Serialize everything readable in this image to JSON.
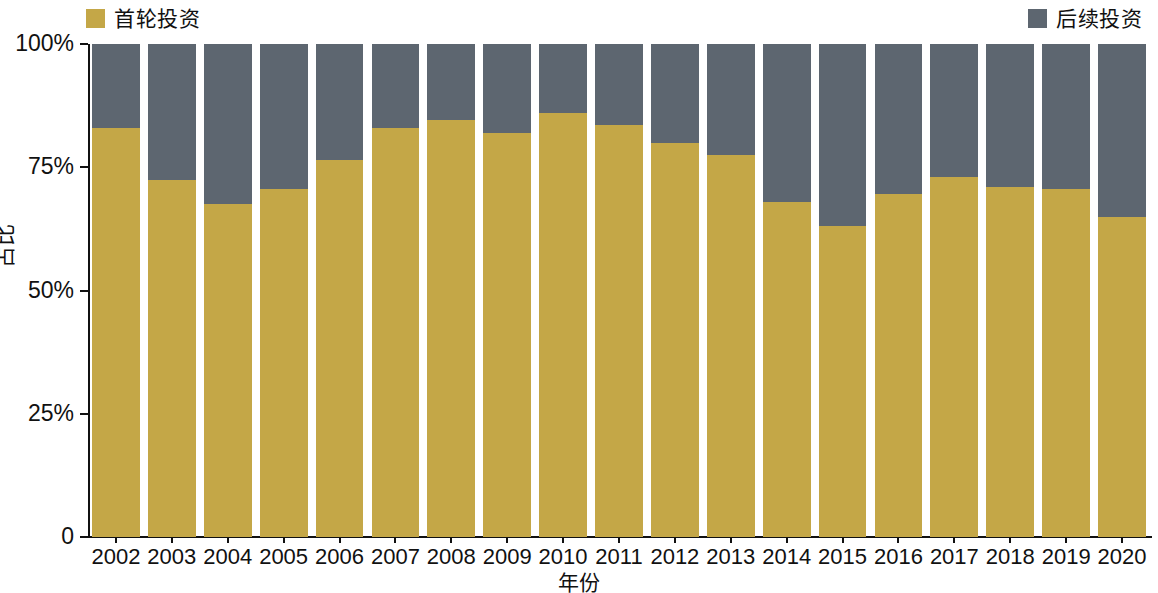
{
  "legend": {
    "position": "top",
    "entries": [
      {
        "label": "首轮投资",
        "color": "#c4a747",
        "key": "first_round"
      },
      {
        "label": "后续投资",
        "color": "#5d6670",
        "key": "follow_on"
      }
    ]
  },
  "axes": {
    "y_title": "占比",
    "x_title": "年份",
    "y_ticks": [
      "0",
      "25%",
      "50%",
      "75%",
      "100%"
    ]
  },
  "chart_data": {
    "type": "bar",
    "title": "",
    "subtitle": "",
    "stacked": true,
    "stack_normalized": true,
    "xlabel": "年份",
    "ylabel": "占比",
    "ylim": [
      0,
      100
    ],
    "yticks": [
      0,
      25,
      50,
      75,
      100
    ],
    "ytick_labels": [
      "0",
      "25%",
      "50%",
      "75%",
      "100%"
    ],
    "grid": false,
    "legend_position": "top",
    "categories": [
      "2002",
      "2003",
      "2004",
      "2005",
      "2006",
      "2007",
      "2008",
      "2009",
      "2010",
      "2011",
      "2012",
      "2013",
      "2014",
      "2015",
      "2016",
      "2017",
      "2018",
      "2019",
      "2020"
    ],
    "series": [
      {
        "name": "首轮投资",
        "color": "#c4a747",
        "values": [
          83,
          72.5,
          67.5,
          70.5,
          76.5,
          83,
          84.5,
          82,
          86,
          83.5,
          80,
          77.5,
          68,
          63,
          69.5,
          73,
          71,
          70.5,
          65
        ]
      },
      {
        "name": "后续投资",
        "color": "#5d6670",
        "values": [
          17,
          27.5,
          32.5,
          29.5,
          23.5,
          17,
          15.5,
          18,
          14,
          16.5,
          20,
          22.5,
          32,
          37,
          30.5,
          27,
          29,
          29.5,
          35
        ]
      }
    ]
  }
}
